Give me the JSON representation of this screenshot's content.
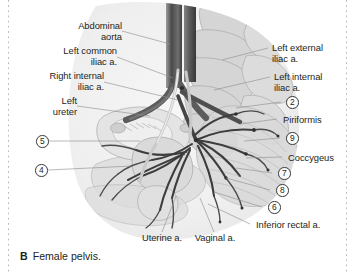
{
  "figure": {
    "caption_letter": "B",
    "caption_text": "Female pelvis."
  },
  "labels_left": [
    {
      "id": "abdominal-aorta",
      "text": "Abdominal\naorta"
    },
    {
      "id": "left-common-iliac-a",
      "text": "Left common\niliac a."
    },
    {
      "id": "right-internal-iliac-a",
      "text": "Right internal\niliac a."
    },
    {
      "id": "left-ureter",
      "text": "Left\nureter"
    }
  ],
  "labels_right": [
    {
      "id": "left-external-iliac-a",
      "text": "Left external\niliac a."
    },
    {
      "id": "left-internal-iliac-a",
      "text": "Left internal\niliac a."
    },
    {
      "id": "piriformis",
      "text": "Piriformis"
    },
    {
      "id": "coccygeus",
      "text": "Coccygeus"
    },
    {
      "id": "inferior-rectal-a",
      "text": "Inferior rectal a."
    }
  ],
  "labels_bottom": [
    {
      "id": "uterine-a",
      "text": "Uterine a."
    },
    {
      "id": "vaginal-a",
      "text": "Vaginal a."
    }
  ],
  "callout_numbers": {
    "left": [
      "5",
      "4"
    ],
    "right": [
      "2",
      "9",
      "7",
      "8",
      "6"
    ]
  },
  "colors": {
    "artery": "#6e6e6e",
    "artery_dark": "#3a3a3a",
    "bone": "#d7d7d7",
    "soft_tissue": "#e8e8e8",
    "outline": "#9a9a9a",
    "leader_line": "#8c8c8c",
    "text": "#231f20",
    "crop_rule": "#b9b9b9",
    "background": "#ffffff"
  }
}
